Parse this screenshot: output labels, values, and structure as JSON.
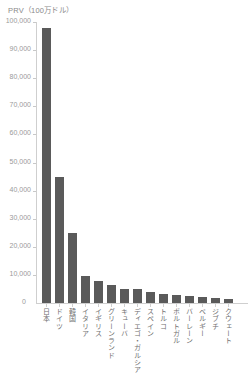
{
  "chart_data": {
    "type": "bar",
    "title": "PRV（100万ドル）",
    "xlabel": "",
    "ylabel": "PRV（100万ドル）",
    "ylim": [
      0,
      100000
    ],
    "ytick_labels": [
      "100,000",
      "90,000",
      "80,000",
      "70,000",
      "60,000",
      "50,000",
      "40,000",
      "30,000",
      "20,000",
      "10,000",
      "0"
    ],
    "ytick_values": [
      100000,
      90000,
      80000,
      70000,
      60000,
      50000,
      40000,
      30000,
      20000,
      10000,
      0
    ],
    "grid": false,
    "legend": "none",
    "bar_color": "#5a5a5a",
    "categories": [
      "日本",
      "ドイツ",
      "韓国",
      "イタリア",
      "イギリス",
      "グリーンランド",
      "キューバ",
      "ディエゴ・ガルシア",
      "スペイン",
      "トルコ",
      "ポルトガル",
      "バーレーン",
      "ベルギー",
      "ジブチ",
      "クウェート"
    ],
    "values": [
      98000,
      45000,
      25000,
      9500,
      8000,
      6500,
      5000,
      5000,
      4000,
      3200,
      2800,
      2500,
      2200,
      1900,
      1500
    ]
  },
  "axis": {
    "zero_label": "0"
  }
}
